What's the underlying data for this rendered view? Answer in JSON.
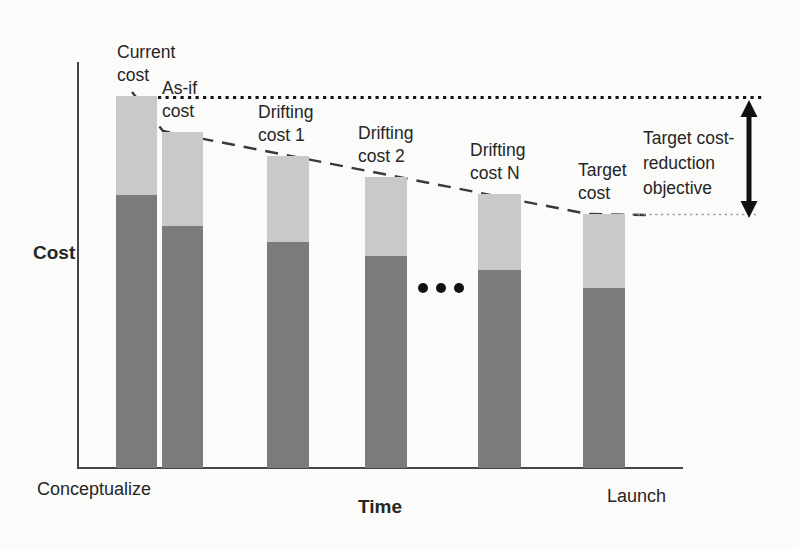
{
  "figure": {
    "y_axis_label": "Cost",
    "x_axis_label": "Time",
    "x_start_label": "Conceptualize",
    "x_end_label": "Launch",
    "annotation_lines": [
      "Target cost-",
      "reduction",
      "objective"
    ]
  },
  "chart_data": {
    "type": "bar",
    "stacked": true,
    "title": "",
    "xlabel": "Time",
    "ylabel": "Cost",
    "x_range_labels": [
      "Conceptualize",
      "Launch"
    ],
    "categories": [
      "Current cost",
      "As-if cost",
      "Drifting cost 1",
      "Drifting cost 2",
      "Drifting cost N",
      "Target cost"
    ],
    "series": [
      {
        "name": "lower-dark-segment",
        "color": "#7b7b7b",
        "values": [
          73,
          65,
          61,
          57,
          53,
          48
        ]
      },
      {
        "name": "upper-light-segment",
        "color": "#c9c9c9",
        "values": [
          27,
          25,
          23,
          21,
          21,
          20
        ]
      }
    ],
    "totals_relative": [
      100,
      90,
      84,
      78,
      74,
      68
    ],
    "value_units": "relative height, current cost = 100 (axis has no tick labels)",
    "legend": "none",
    "grid": false,
    "annotations": [
      {
        "name": "top-dotted-line",
        "meaning": "current cost level extended to the right"
      },
      {
        "name": "dashed-drift-line",
        "meaning": "declining cost trajectory across bar tops"
      },
      {
        "name": "target-level-dotted-line",
        "meaning": "target cost level extended to the right"
      },
      {
        "name": "double-headed-arrow",
        "label": "Target cost-reduction objective"
      },
      {
        "name": "continuation-dots",
        "meaning": "ellipsis between Drifting cost 2 and Drifting cost N"
      }
    ],
    "layout_px": {
      "baseline_y": 468,
      "bars": [
        {
          "x": 116,
          "w": 41,
          "top": 96,
          "split": 195,
          "label_lines": [
            "Current",
            "cost"
          ],
          "label_dx": 1
        },
        {
          "x": 162,
          "w": 41,
          "top": 132,
          "split": 226,
          "label_lines": [
            "As-if",
            "cost"
          ],
          "label_dx": 0
        },
        {
          "x": 267,
          "w": 42,
          "top": 156,
          "split": 242,
          "label_lines": [
            "Drifting",
            "cost 1"
          ],
          "label_dx": -9
        },
        {
          "x": 365,
          "w": 42,
          "top": 177,
          "split": 256,
          "label_lines": [
            "Drifting",
            "cost 2"
          ],
          "label_dx": -7
        },
        {
          "x": 478,
          "w": 43,
          "top": 194,
          "split": 270,
          "label_lines": [
            "Drifting",
            "cost N"
          ],
          "label_dx": -8
        },
        {
          "x": 583,
          "w": 42,
          "top": 214,
          "split": 288,
          "label_lines": [
            "Target",
            "cost"
          ],
          "label_dx": -5
        }
      ]
    }
  }
}
